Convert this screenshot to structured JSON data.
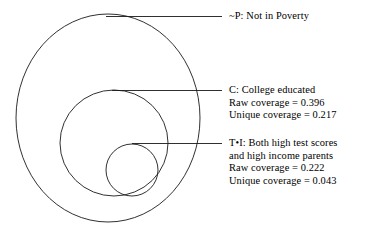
{
  "figure": {
    "type": "euler-nested-set-diagram",
    "background_color": "#ffffff",
    "stroke_color": "#1a1a1a"
  },
  "sets": [
    {
      "id": "not-poverty",
      "symbol": "~P",
      "title": "~P: Not in Poverty",
      "description": "Not in Poverty",
      "lines": [
        "~P: Not in Poverty"
      ],
      "geometry": {
        "cx": 108,
        "cy": 118,
        "rx": 92,
        "ry": 104
      },
      "leader": {
        "x1": 106,
        "y1": 16,
        "x2": 222,
        "y2": 16
      }
    },
    {
      "id": "college",
      "symbol": "C",
      "title": "C: College educated",
      "description": "College educated",
      "raw_coverage_label": "Raw coverage = 0.396",
      "unique_coverage_label": "Unique coverage = 0.217",
      "raw_coverage": 0.396,
      "unique_coverage": 0.217,
      "lines": [
        "C: College educated",
        "Raw coverage = 0.396",
        "Unique coverage = 0.217"
      ],
      "geometry": {
        "cx": 114,
        "cy": 143,
        "rx": 54,
        "ry": 53
      },
      "leader": {
        "x1": 112,
        "y1": 90,
        "x2": 222,
        "y2": 90
      }
    },
    {
      "id": "test-income",
      "symbol": "T•I",
      "title": "T•I: Both high test scores",
      "description": "Both high test scores and high income parents",
      "title_line2": "and high income parents",
      "raw_coverage_label": "Raw coverage = 0.222",
      "unique_coverage_label": "Unique coverage = 0.043",
      "raw_coverage": 0.222,
      "unique_coverage": 0.043,
      "lines": [
        "T•I: Both high test scores",
        "and high income parents",
        "Raw coverage = 0.222",
        "Unique coverage = 0.043"
      ],
      "geometry": {
        "cx": 132,
        "cy": 170,
        "rx": 26,
        "ry": 26
      },
      "leader": {
        "x1": 132,
        "y1": 143,
        "x2": 222,
        "y2": 143
      }
    }
  ],
  "chart_data": {
    "type": "table",
    "title": "",
    "categories": [
      "~P: Not in Poverty",
      "C: College educated",
      "T•I: Both high test scores and high income parents"
    ],
    "series": [
      {
        "name": "Raw coverage",
        "values": [
          null,
          0.396,
          0.222
        ]
      },
      {
        "name": "Unique coverage",
        "values": [
          null,
          0.217,
          0.043
        ]
      }
    ],
    "xlabel": "",
    "ylabel": "",
    "grid": false,
    "legend": "none"
  }
}
